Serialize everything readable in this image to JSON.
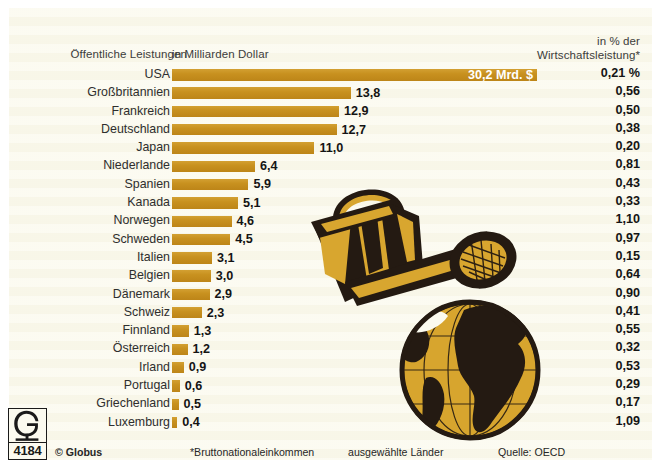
{
  "header": {
    "category_label": "Öffentliche Leistungen",
    "unit_label": "in Milliarden Dollar",
    "pct_label_line1": "in % der",
    "pct_label_line2": "Wirtschaftsleistung*"
  },
  "footer": {
    "copyright": "© Globus",
    "footnote": "*Bruttonationaleinkommen",
    "selection": "ausgewählte Länder",
    "source": "Quelle: OECD",
    "logo_letter": "G",
    "logo_number": "4184"
  },
  "colors": {
    "bar": "#c8911f",
    "panel_bg": "#fbfaef",
    "text": "#2e2e2e",
    "value_text": "#141414",
    "illustration_dark": "#241a12",
    "illustration_gold": "#d8a62f"
  },
  "chart_data": {
    "type": "bar",
    "title": "Öffentliche Leistungen",
    "subtitle": "in Milliarden Dollar",
    "xlabel": "in Milliarden Dollar",
    "ylabel": "",
    "orientation": "horizontal",
    "grid": false,
    "legend": null,
    "xlim": [
      0,
      30.2
    ],
    "note": "USA bar is drawn compressed relative to scale; value shown inside bar",
    "categories": [
      "USA",
      "Großbritannien",
      "Frankreich",
      "Deutschland",
      "Japan",
      "Niederlande",
      "Spanien",
      "Kanada",
      "Norwegen",
      "Schweden",
      "Italien",
      "Belgien",
      "Dänemark",
      "Schweiz",
      "Finnland",
      "Österreich",
      "Irland",
      "Portugal",
      "Griechenland",
      "Luxemburg"
    ],
    "values": [
      30.2,
      13.8,
      12.9,
      12.7,
      11.0,
      6.4,
      5.9,
      5.1,
      4.6,
      4.5,
      3.1,
      3.0,
      2.9,
      2.3,
      1.3,
      1.2,
      0.9,
      0.6,
      0.5,
      0.4
    ],
    "value_labels": [
      "30,2 Mrd. $",
      "13,8",
      "12,9",
      "12,7",
      "11,0",
      "6,4",
      "5,9",
      "5,1",
      "4,6",
      "4,5",
      "3,1",
      "3,0",
      "2,9",
      "2,3",
      "1,3",
      "1,2",
      "0,9",
      "0,6",
      "0,5",
      "0,4"
    ],
    "secondary_series": {
      "name": "in % der Wirtschaftsleistung*",
      "labels": [
        "0,21 %",
        "0,56",
        "0,50",
        "0,38",
        "0,20",
        "0,81",
        "0,43",
        "0,33",
        "1,10",
        "0,97",
        "0,15",
        "0,64",
        "0,90",
        "0,41",
        "0,55",
        "0,32",
        "0,53",
        "0,29",
        "0,17",
        "1,09"
      ],
      "values": [
        0.21,
        0.56,
        0.5,
        0.38,
        0.2,
        0.81,
        0.43,
        0.33,
        1.1,
        0.97,
        0.15,
        0.64,
        0.9,
        0.41,
        0.55,
        0.32,
        0.53,
        0.29,
        0.17,
        1.09
      ]
    }
  },
  "illustration": {
    "watering_can": "watering-can-illustration",
    "globe": "globe-illustration"
  }
}
